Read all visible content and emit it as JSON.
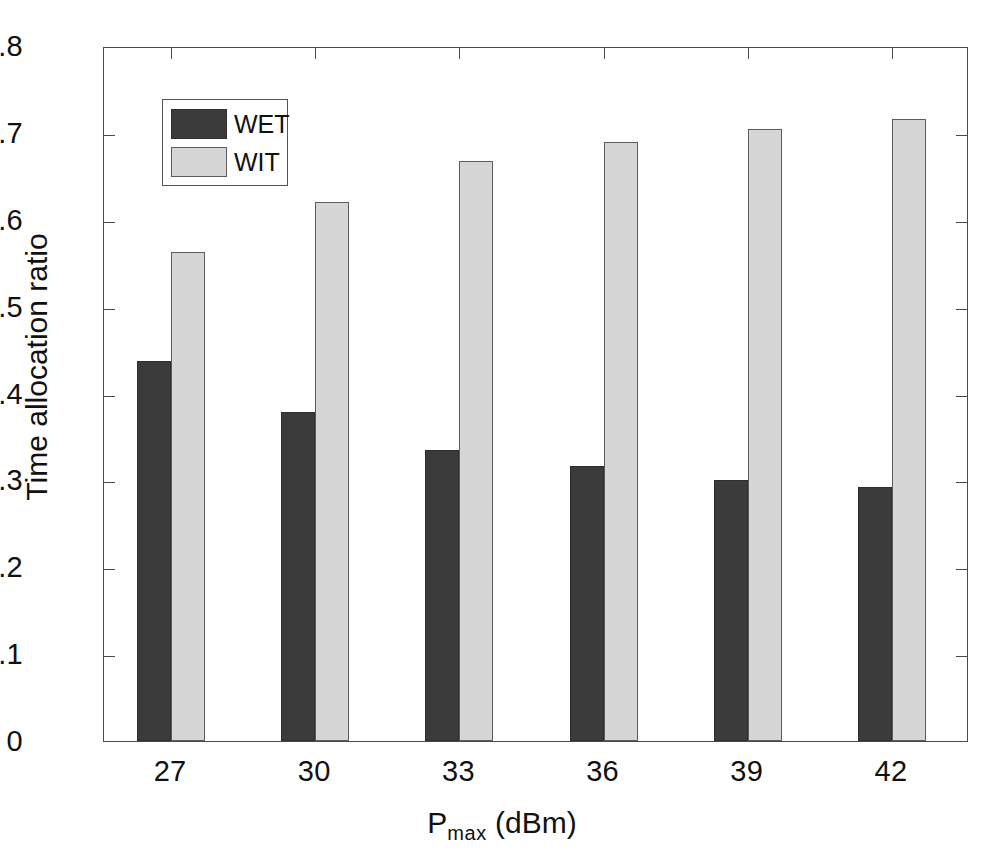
{
  "chart_data": {
    "type": "bar",
    "title": "",
    "subtitle": "",
    "xlabel": "P_max (dBm)",
    "xlabel_base": "P",
    "xlabel_sub": "max",
    "xlabel_unit": " (dBm)",
    "ylabel": "Time allocation ratio",
    "categories": [
      "27",
      "30",
      "33",
      "36",
      "39",
      "42"
    ],
    "series": [
      {
        "name": "WET",
        "color": "#3b3b3b",
        "values": [
          0.437,
          0.379,
          0.335,
          0.316,
          0.301,
          0.292
        ]
      },
      {
        "name": "WIT",
        "color": "#d6d6d6",
        "values": [
          0.563,
          0.621,
          0.668,
          0.689,
          0.705,
          0.716
        ]
      }
    ],
    "ylim": [
      0,
      0.8
    ],
    "ytick_values": [
      0,
      0.1,
      0.2,
      0.3,
      0.4,
      0.5,
      0.6,
      0.7,
      0.8
    ],
    "ytick_labels": [
      "0",
      "0.1",
      "0.2",
      "0.3",
      "0.4",
      "0.5",
      "0.6",
      "0.7",
      "0.8"
    ],
    "grid": false,
    "legend_position": "upper-left",
    "legend_entries": [
      "WET",
      "WIT"
    ],
    "axis_color": "#4a4a4a",
    "background_color": "#ffffff"
  }
}
